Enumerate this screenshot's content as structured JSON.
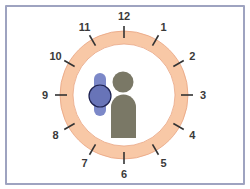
{
  "diagram": {
    "clock": {
      "center": [
        124,
        95
      ],
      "outer_radius": 64,
      "inner_radius": 51,
      "ring_color": "#f8c8a6",
      "ring_edge_color": "#e9a583",
      "hour_labels": [
        "12",
        "1",
        "2",
        "3",
        "4",
        "5",
        "6",
        "7",
        "8",
        "9",
        "10",
        "11"
      ],
      "tick_color": "#333333",
      "label_color": "#3a3a3a"
    },
    "person": {
      "icon": "person-icon",
      "color": "#7a7866"
    },
    "watch": {
      "icon": "wristwatch-icon",
      "band_color": "#7c88c8",
      "face_color": "#6874b8",
      "face_stroke": "#1e2250"
    },
    "frame_border_color": "#9ea3c0"
  }
}
